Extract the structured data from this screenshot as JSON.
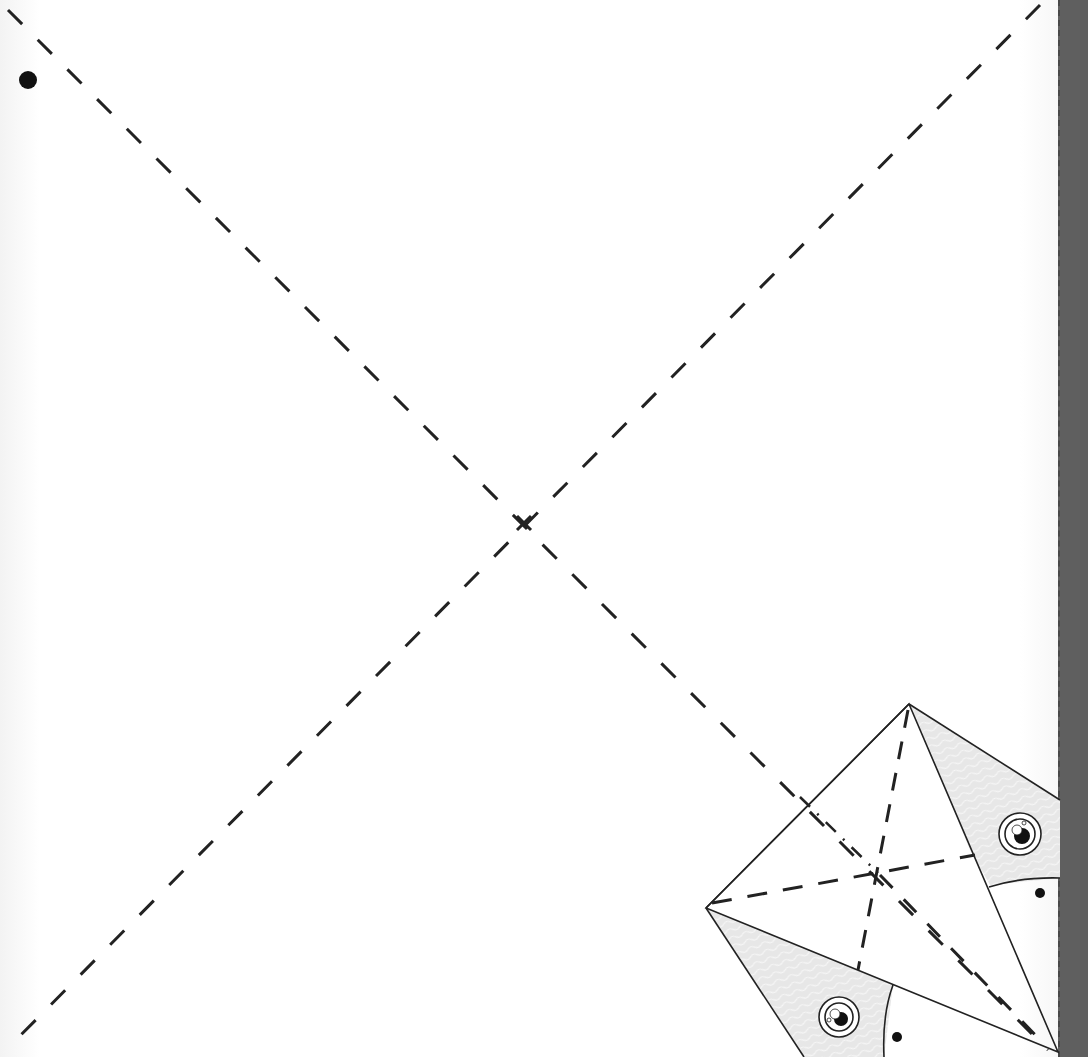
{
  "diagram": {
    "type": "origami-instruction",
    "colors": {
      "line": "#222222",
      "paper": "#ffffff",
      "patterned_side": "#e6e6e6",
      "spine": "#5f5f5f"
    },
    "marks": {
      "corner_dot": "reference-dot",
      "center_mark": "x-mark"
    },
    "fold_lines": [
      {
        "name": "diagonal-1",
        "style": "valley-fold"
      },
      {
        "name": "diagonal-2",
        "style": "valley-fold"
      }
    ],
    "inset": {
      "eyes": 2,
      "dots": 2,
      "creases": [
        "valley-fold",
        "valley-fold",
        "valley-fold",
        "mountain-fold"
      ]
    }
  }
}
